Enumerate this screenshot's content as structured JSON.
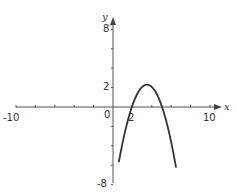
{
  "chart_data": {
    "type": "line",
    "title": "",
    "xlabel": "x",
    "ylabel": "y",
    "xlim": [
      -10,
      10
    ],
    "ylim": [
      -8,
      8
    ],
    "grid": false,
    "x_tick_labels": [
      "-10",
      "0",
      "2",
      "10"
    ],
    "y_tick_labels": [
      "8",
      "2",
      "-8"
    ],
    "x_tick_step": 2,
    "y_tick_step": 2,
    "series": [
      {
        "name": "parabola",
        "function": "y = -0.95*(x-3.5)^2 + 2.3",
        "x": [
          0.6,
          1.0,
          1.5,
          2.0,
          2.5,
          3.0,
          3.5,
          4.0,
          4.5,
          5.0,
          5.5,
          6.0,
          6.5
        ],
        "y": [
          -5.7,
          -3.6,
          -1.5,
          0.2,
          1.35,
          2.06,
          2.3,
          2.06,
          1.35,
          0.2,
          -1.5,
          -3.6,
          -6.25
        ]
      }
    ]
  },
  "labels": {
    "x_axis_name": "x",
    "y_axis_name": "y",
    "x_min": "-10",
    "x_max": "10",
    "origin": "0",
    "x_two": "2",
    "y_max": "8",
    "y_two": "2",
    "y_min": "-8"
  },
  "colors": {
    "axis": "#555555",
    "curve": "#333333",
    "text": "#333333"
  }
}
